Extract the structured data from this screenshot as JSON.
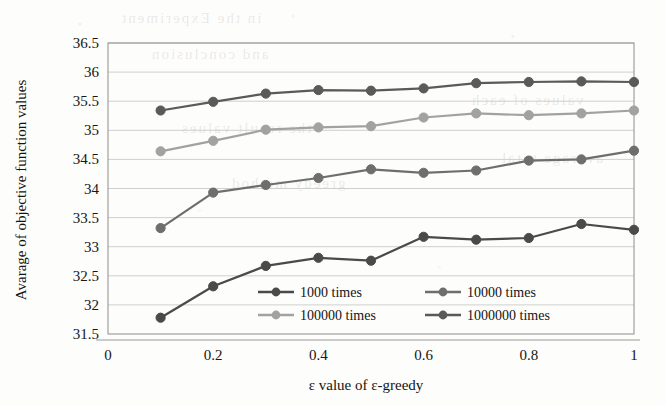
{
  "figure": {
    "background_color": "#fdfdfb",
    "plot_frame_color": "#8d8d8d",
    "gridline_color": "#c9c9c9"
  },
  "ghost_text": [
    {
      "text": "in the Experiment",
      "x": 120,
      "y": 10
    },
    {
      "text": "and conclusion",
      "x": 150,
      "y": 46
    },
    {
      "text": "the result values",
      "x": 180,
      "y": 120
    },
    {
      "text": "greedy method",
      "x": 230,
      "y": 175
    },
    {
      "text": "values of each",
      "x": 470,
      "y": 92
    },
    {
      "text": "average total",
      "x": 500,
      "y": 150
    }
  ],
  "chart_data": {
    "type": "line",
    "title": "",
    "xlabel": "ε value of ε-greedy",
    "ylabel": "Avarage of objective function values",
    "x": [
      0.1,
      0.2,
      0.3,
      0.4,
      0.5,
      0.6,
      0.7,
      0.8,
      0.9,
      1.0
    ],
    "xlim": [
      0,
      1
    ],
    "ylim": [
      31.5,
      36.5
    ],
    "xticks": [
      "0",
      "0.2",
      "0.4",
      "0.6",
      "0.8",
      "1"
    ],
    "xtick_values": [
      0,
      0.2,
      0.4,
      0.6,
      0.8,
      1
    ],
    "yticks": [
      "31.5",
      "32",
      "32.5",
      "33",
      "33.5",
      "34",
      "34.5",
      "35",
      "35.5",
      "36",
      "36.5"
    ],
    "ytick_values": [
      31.5,
      32,
      32.5,
      33,
      33.5,
      34,
      34.5,
      35,
      35.5,
      36,
      36.5
    ],
    "grid": true,
    "legend_position": "inside-bottom-center",
    "series": [
      {
        "name": "1000 times",
        "color": "#4a4a4a",
        "marker": "circle",
        "values": [
          31.78,
          32.32,
          32.67,
          32.81,
          32.76,
          33.17,
          33.12,
          33.15,
          33.39,
          33.29
        ]
      },
      {
        "name": "10000 times",
        "color": "#6e6e6e",
        "marker": "circle",
        "values": [
          33.32,
          33.93,
          34.06,
          34.18,
          34.33,
          34.27,
          34.31,
          34.48,
          34.5,
          34.65
        ]
      },
      {
        "name": "100000 times",
        "color": "#a2a2a2",
        "marker": "circle",
        "values": [
          34.64,
          34.82,
          35.01,
          35.05,
          35.07,
          35.22,
          35.29,
          35.26,
          35.29,
          35.34
        ]
      },
      {
        "name": "1000000 times",
        "color": "#5a5a5a",
        "marker": "circle",
        "values": [
          35.34,
          35.49,
          35.63,
          35.69,
          35.68,
          35.72,
          35.81,
          35.83,
          35.84,
          35.83
        ]
      }
    ]
  },
  "legend": {
    "entries": [
      {
        "label": "1000 times",
        "color": "#4a4a4a"
      },
      {
        "label": "10000 times",
        "color": "#6e6e6e"
      },
      {
        "label": "100000 times",
        "color": "#a2a2a2"
      },
      {
        "label": "1000000 times",
        "color": "#5a5a5a"
      }
    ]
  }
}
